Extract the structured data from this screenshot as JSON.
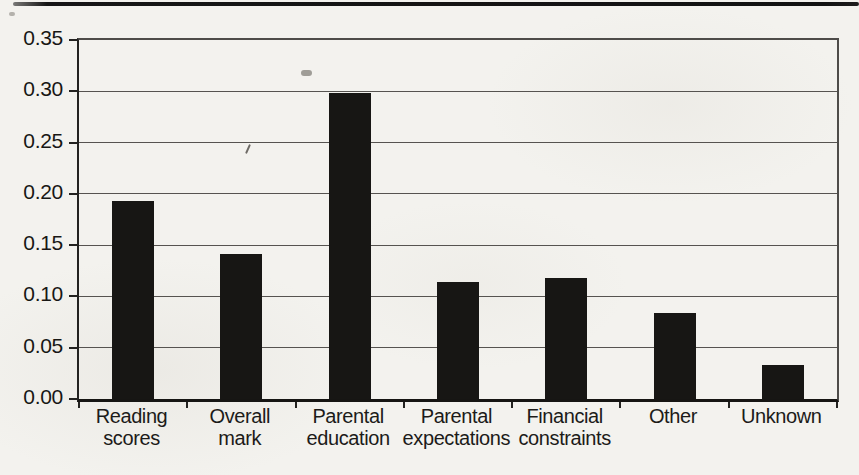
{
  "page": {
    "kind": "scanned bar chart figure",
    "paper_color": "#f3f2ee",
    "artifacts": [
      "scan-line-top",
      "slash-speck",
      "smudge-speck"
    ]
  },
  "chart_data": {
    "type": "bar",
    "title": "",
    "xlabel": "",
    "ylabel": "",
    "categories": [
      "Reading scores",
      "Overall mark",
      "Parental education",
      "Parental expectations",
      "Financial constraints",
      "Other",
      "Unknown"
    ],
    "category_lines": [
      [
        "Reading",
        "scores"
      ],
      [
        "Overall",
        "mark"
      ],
      [
        "Parental",
        "education"
      ],
      [
        "Parental",
        "expectations"
      ],
      [
        "Financial",
        "constraints"
      ],
      [
        "Other"
      ],
      [
        "Unknown"
      ]
    ],
    "values": [
      0.193,
      0.141,
      0.298,
      0.114,
      0.118,
      0.084,
      0.033
    ],
    "ylim": [
      0,
      0.35
    ],
    "ytick_step": 0.05,
    "ytick_labels": [
      "0.00",
      "0.05",
      "0.10",
      "0.15",
      "0.20",
      "0.25",
      "0.30",
      "0.35"
    ],
    "grid": "horizontal gridlines at every 0.05",
    "legend": "none",
    "bar_color": "#171614",
    "single_series": true
  }
}
